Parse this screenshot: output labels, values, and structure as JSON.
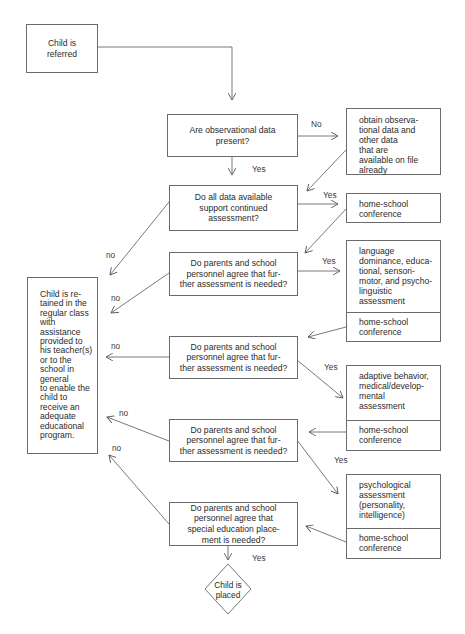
{
  "flowchart": {
    "start": {
      "text": "Child is\nreferred"
    },
    "decisions": [
      {
        "id": "q1",
        "text": "Are observational data\npresent?"
      },
      {
        "id": "q2",
        "text": "Do all data available\nsupport continued\nassessment?"
      },
      {
        "id": "q3",
        "text": "Do parents and school\npersonnel agree that fur-\nther assessment is needed?"
      },
      {
        "id": "q4",
        "text": "Do parents and school\npersonnel agree that fur-\nther assessment is needed?"
      },
      {
        "id": "q5",
        "text": "Do parents and school\npersonnel agree that fur-\nther assessment is needed?"
      },
      {
        "id": "q6",
        "text": "Do parents and school\npersonnel agree that\nspecial education place-\nment is needed?"
      }
    ],
    "actions": {
      "obtain": "obtain observa-\ntional data and\nother data\nthat are\navailable on file\nalready",
      "home_school_1": "home-school\nconference",
      "language": "language\ndominance, educa-\ntional, sensori-\nmotor, and psycho-\nlinguistic\nassessment",
      "home_school_2": "home-school\nconference",
      "adaptive": "adaptive behavior,\nmedical/develop-\nmental\nassessment",
      "home_school_3": "home-school\nconference",
      "psychological": "psychological\nassessment\n(personality,\nintelligence)",
      "home_school_4": "home-school\nconference"
    },
    "retained": {
      "text": "Child is re-\ntained in the\nregular class\nwith\nassistance\nprovided to\nhis teacher(s)\nor to the\nschool in\ngeneral\nto enable the\nchild to\nreceive an\nadequate\neducational\nprogram."
    },
    "end": {
      "text": "Child is\nplaced"
    },
    "edge_labels": {
      "q1_no": "No",
      "q1_yes": "Yes",
      "q2_yes": "Yes",
      "q2_no": "no",
      "q3_yes": "Yes",
      "q3_no": "no",
      "q4_yes": "Yes",
      "q4_no": "no",
      "q5_yes": "Yes",
      "q5_no": "no",
      "q6_no": "no",
      "q6_yes": "Yes"
    },
    "colors": {
      "line": "#6a6a6a",
      "text": "#2a2a2a",
      "background": "#ffffff"
    }
  }
}
